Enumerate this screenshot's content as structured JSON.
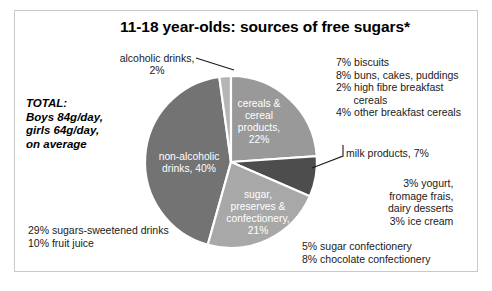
{
  "title": "11-18 year-olds: sources of free sugars*",
  "total_note": "TOTAL:\nBoys 84g/day,\ngirls 64g/day,\non average",
  "callouts": {
    "alcoholic": "alcoholic drinks,\n2%",
    "cereals_breakdown": "7% biscuits\n8% buns, cakes, puddings\n2% high fibre breakfast\n      cereals\n4% other breakfast cereals",
    "milk_products": "milk products, 7%",
    "milk_breakdown": "3% yogurt,\nfromage frais,\ndairy desserts\n3% ice cream",
    "confectionery_breakdown": "5% sugar confectionery\n8% chocolate confectionery",
    "drinks_breakdown": "29% sugars-sweetened drinks\n10% fruit juice"
  },
  "chart_data": {
    "type": "pie",
    "title": "11-18 year-olds: sources of free sugars*",
    "categories": [
      "non-alcoholic drinks",
      "cereals & cereal products",
      "sugar, preserves & confectionery",
      "milk products",
      "alcoholic drinks"
    ],
    "values": [
      40,
      22,
      21,
      7,
      2
    ],
    "units": "%",
    "colors": [
      "#737373",
      "#999999",
      "#a8a8a8",
      "#4d4d4d",
      "#b5b5b5"
    ],
    "slice_labels": [
      "non-alcoholic\ndrinks, 40%",
      "cereals &\ncereal\nproducts,\n22%",
      "sugar,\npreserves &\nconfectionery,\n21%",
      "",
      ""
    ],
    "legend": "none",
    "grid": false,
    "start_angle_deg": -90,
    "direction": "clockwise",
    "annotations": [
      "alcoholic drinks, 2%",
      "7% biscuits",
      "8% buns, cakes, puddings",
      "2% high fibre breakfast cereals",
      "4% other breakfast cereals",
      "milk products, 7%",
      "3% yogurt, fromage frais, dairy desserts",
      "3% ice cream",
      "5% sugar confectionery",
      "8% chocolate confectionery",
      "29% sugars-sweetened drinks",
      "10% fruit juice"
    ]
  },
  "slice_text": {
    "non_alcoholic_l1": "non-alcoholic",
    "non_alcoholic_l2": "drinks, 40%",
    "cereals_l1": "cereals &",
    "cereals_l2": "cereal",
    "cereals_l3": "products,",
    "cereals_l4": "22%",
    "sugar_l1": "sugar,",
    "sugar_l2": "preserves &",
    "sugar_l3": "confectionery,",
    "sugar_l4": "21%"
  }
}
